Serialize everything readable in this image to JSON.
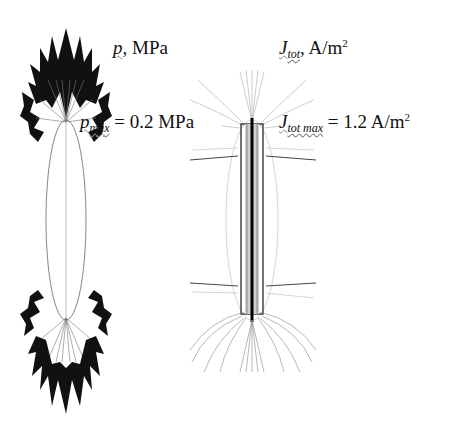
{
  "figure": {
    "left_panel": {
      "quantity_symbol": "p",
      "quantity_unit": ", MPa",
      "max_symbol": "p",
      "max_subscript": "max",
      "max_value_text": " = 0.2 MPa",
      "description": "Pressure distribution around elongated ellipsoidal body (arrows at both poles)"
    },
    "right_panel": {
      "quantity_symbol": "J",
      "quantity_subscript": "tot",
      "quantity_unit": ", A/m",
      "quantity_unit_sup": "2",
      "max_symbol": "J",
      "max_subscript": "tot max",
      "max_value_text": " = 1.2 A/m",
      "max_value_sup": "2",
      "description": "Total current density field lines around elongated body"
    }
  }
}
